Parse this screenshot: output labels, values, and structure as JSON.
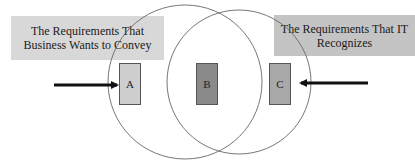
{
  "labels": {
    "left": "The Requirements That Business Wants to Convey",
    "right": "The Requirements That IT Recognizes"
  },
  "regions": [
    {
      "id": "A",
      "label": "A",
      "description": "business-only region"
    },
    {
      "id": "B",
      "label": "B",
      "description": "overlap region"
    },
    {
      "id": "C",
      "label": "C",
      "description": "IT-only region"
    }
  ],
  "colors": {
    "left_label_bg": "#d8d8d8",
    "right_label_bg": "#c4c4c4",
    "box_a": "#cfcfcf",
    "box_b": "#8a8a8a",
    "box_c": "#a9a9a9",
    "circle_stroke": "#666666",
    "arrow": "#111111"
  }
}
